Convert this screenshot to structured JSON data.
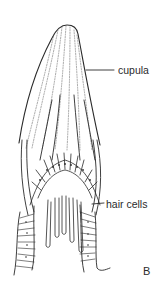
{
  "figure": {
    "panel_letter": "B",
    "labels": {
      "cupula": "cupula",
      "hair_cells": "hair cells"
    },
    "colors": {
      "ink": "#2a2a2a",
      "background": "#ffffff"
    }
  }
}
